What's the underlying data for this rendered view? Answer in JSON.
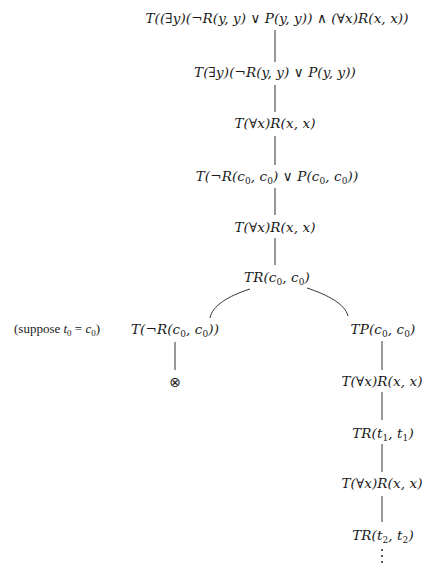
{
  "diagram": {
    "type": "semantic-tableau",
    "nodes": {
      "root": "T((∃y)(¬R(y,y) ∨ P(y,y)) ∧ (∀x)R(x,x))",
      "n2": "T(∃y)(¬R(y,y) ∨ P(y,y))",
      "n3": "T(∀x)R(x,x)",
      "n4": "T(¬R(c0,c0) ∨ P(c0,c0))",
      "n5": "T(∀x)R(x,x)",
      "n6": "TR(c0,c0)",
      "left_branch": "T(¬R(c0,c0))",
      "left_closed": "⊗",
      "right_branch": "TP(c0,c0)",
      "r2": "T(∀x)R(x,x)",
      "r3": "TR(t1,t1)",
      "r4": "T(∀x)R(x,x)",
      "r5": "TR(t2,t2)",
      "r_continue": "⋮"
    },
    "annotation": "(suppose t0 = c0)",
    "edges": [
      [
        "root",
        "n2"
      ],
      [
        "n2",
        "n3"
      ],
      [
        "n3",
        "n4"
      ],
      [
        "n4",
        "n5"
      ],
      [
        "n5",
        "n6"
      ],
      [
        "n6",
        "left_branch"
      ],
      [
        "n6",
        "right_branch"
      ],
      [
        "left_branch",
        "left_closed"
      ],
      [
        "right_branch",
        "r2"
      ],
      [
        "r2",
        "r3"
      ],
      [
        "r3",
        "r4"
      ],
      [
        "r4",
        "r5"
      ],
      [
        "r5",
        "r_continue"
      ]
    ]
  }
}
